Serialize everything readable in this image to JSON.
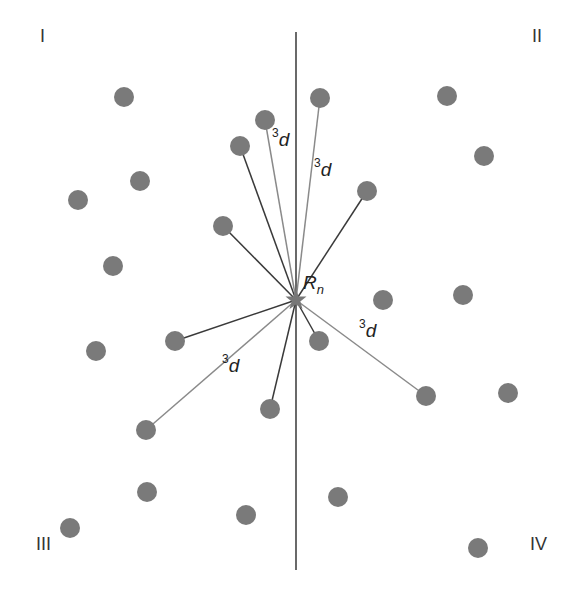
{
  "diagram": {
    "colors": {
      "dot": "#7a7a7a",
      "axis": "#444444",
      "near_bond": "#3a3a3a",
      "third_neighbor_bond": "#8a8a8a",
      "star": "#777777"
    },
    "axis_line": {
      "x": 296,
      "y1": 32,
      "y2": 570
    },
    "center": {
      "x": 296,
      "y": 300,
      "label_base": "R",
      "label_sub": "n"
    },
    "quadrants": [
      {
        "label": "I",
        "x": 40,
        "y": 38
      },
      {
        "label": "II",
        "x": 532,
        "y": 38
      },
      {
        "label": "III",
        "x": 36,
        "y": 546
      },
      {
        "label": "IV",
        "x": 530,
        "y": 546
      }
    ],
    "dots": [
      {
        "x": 124,
        "y": 97
      },
      {
        "x": 265,
        "y": 120
      },
      {
        "x": 320,
        "y": 98
      },
      {
        "x": 447,
        "y": 96
      },
      {
        "x": 484,
        "y": 156
      },
      {
        "x": 240,
        "y": 146
      },
      {
        "x": 140,
        "y": 181
      },
      {
        "x": 78,
        "y": 200
      },
      {
        "x": 367,
        "y": 191
      },
      {
        "x": 223,
        "y": 226
      },
      {
        "x": 113,
        "y": 266
      },
      {
        "x": 383,
        "y": 300
      },
      {
        "x": 463,
        "y": 295
      },
      {
        "x": 175,
        "y": 341
      },
      {
        "x": 96,
        "y": 351
      },
      {
        "x": 319,
        "y": 341
      },
      {
        "x": 426,
        "y": 396
      },
      {
        "x": 508,
        "y": 393
      },
      {
        "x": 270,
        "y": 409
      },
      {
        "x": 146,
        "y": 430
      },
      {
        "x": 147,
        "y": 492
      },
      {
        "x": 246,
        "y": 515
      },
      {
        "x": 338,
        "y": 497
      },
      {
        "x": 70,
        "y": 528
      },
      {
        "x": 478,
        "y": 548
      }
    ],
    "bonds": [
      {
        "x": 240,
        "y": 146,
        "type": "near"
      },
      {
        "x": 265,
        "y": 120,
        "type": "third"
      },
      {
        "x": 320,
        "y": 98,
        "type": "third"
      },
      {
        "x": 367,
        "y": 191,
        "type": "near"
      },
      {
        "x": 223,
        "y": 226,
        "type": "near"
      },
      {
        "x": 175,
        "y": 341,
        "type": "near"
      },
      {
        "x": 146,
        "y": 430,
        "type": "third"
      },
      {
        "x": 270,
        "y": 409,
        "type": "near"
      },
      {
        "x": 319,
        "y": 341,
        "type": "near"
      },
      {
        "x": 426,
        "y": 396,
        "type": "third"
      }
    ],
    "distance_labels": [
      {
        "sup": "3",
        "text": "d",
        "x": 272,
        "y": 142
      },
      {
        "sup": "3",
        "text": "d",
        "x": 314,
        "y": 172
      },
      {
        "sup": "3",
        "text": "d",
        "x": 222,
        "y": 368
      },
      {
        "sup": "3",
        "text": "d",
        "x": 359,
        "y": 333
      }
    ]
  }
}
